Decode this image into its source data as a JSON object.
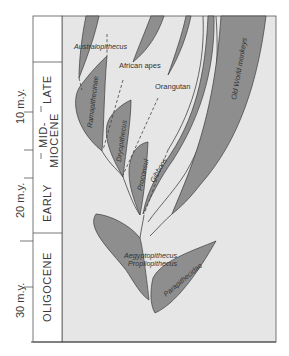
{
  "figure": {
    "time_axis": {
      "ticks": [
        {
          "label": "10 m.y.",
          "value": 10
        },
        {
          "label": "20 m.y.",
          "value": 20
        },
        {
          "label": "30 m.y.",
          "value": 30
        }
      ]
    },
    "epochs": [
      {
        "label": "LATE"
      },
      {
        "label": "MID-"
      },
      {
        "label": "MIOCENE"
      },
      {
        "label": "EARLY"
      },
      {
        "label": "OLIGOCENE"
      }
    ],
    "taxa": {
      "australopithecus": "Australopithecus",
      "african_apes": "African apes",
      "orangutan": "Orangutan",
      "old_world_monkeys": "Old World monkeys",
      "ramapithecinae": "Ramapithecinae",
      "dryopithecus": "Dryopithecus",
      "proconsul": "Proconsul",
      "gibbons": "Gibbons",
      "aegyptopithecus": "Aegyptopithecus",
      "propliopithecus": "Propliopithecus",
      "parapithecidae": "Parapithecidae"
    },
    "colors": {
      "panel_bg": "#e6e6e6",
      "branch_fill": "#8e8e8e",
      "outline": "#3c3c3c"
    }
  }
}
